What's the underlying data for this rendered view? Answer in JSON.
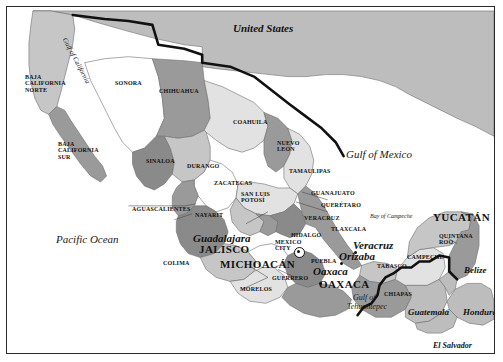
{
  "figure": {
    "width": 503,
    "height": 362
  },
  "palette": {
    "water": "#ffffff",
    "land_light": "#e2e2e2",
    "land_mid": "#c6c6c6",
    "land_dark": "#9a9a9a",
    "land_darker": "#8a8a8a",
    "neighbor_gray": "#bdbdbd",
    "outline": "#6e6e6e",
    "border_bold": "#111111",
    "frame": "#2a2a2a",
    "text": "#121212"
  },
  "countries": [
    {
      "name": "United States",
      "x": 232,
      "y": 22,
      "size": 11,
      "style": "italic"
    },
    {
      "name": "Belize",
      "x": 463,
      "y": 265,
      "size": 9,
      "style": "italic"
    },
    {
      "name": "Guatemala",
      "x": 407,
      "y": 307,
      "size": 9,
      "style": "italic"
    },
    {
      "name": "Honduras",
      "x": 462,
      "y": 307,
      "size": 9,
      "style": "italic"
    },
    {
      "name": "El Salvador",
      "x": 432,
      "y": 341,
      "size": 8,
      "style": "italic"
    }
  ],
  "waters": [
    {
      "name": "Pacific Ocean",
      "x": 55,
      "y": 233,
      "size": 11,
      "rotate": 0
    },
    {
      "name": "Gulf of Mexico",
      "x": 345,
      "y": 148,
      "size": 11,
      "rotate": 0
    },
    {
      "name": "Gulf of California",
      "x": 66,
      "y": 36,
      "size": 7,
      "rotate": 62
    },
    {
      "name": "Bay of Campeche",
      "x": 369,
      "y": 212,
      "size": 6,
      "rotate": 0
    },
    {
      "name": "Gulf of",
      "x": 352,
      "y": 293,
      "size": 8,
      "rotate": 0
    },
    {
      "name": "Tehuantepec",
      "x": 346,
      "y": 302,
      "size": 8,
      "rotate": 0
    }
  ],
  "states": [
    {
      "name": "BAJA CALIFORNIA NORTE",
      "lines": [
        "BAJA",
        "CALIFORNIA",
        "NORTE"
      ],
      "x": 24,
      "y": 73,
      "size": 6
    },
    {
      "name": "BAJA CALIFORNIA SUR",
      "lines": [
        "BAJA",
        "CALIFORNIA",
        "SUR"
      ],
      "x": 57,
      "y": 140,
      "size": 6
    },
    {
      "name": "SONORA",
      "lines": [
        "SONORA"
      ],
      "x": 114,
      "y": 79,
      "size": 6
    },
    {
      "name": "CHIHUAHUA",
      "lines": [
        "CHIHUAHUA"
      ],
      "x": 158,
      "y": 87,
      "size": 6
    },
    {
      "name": "COAHUILA",
      "lines": [
        "COAHUILA"
      ],
      "x": 232,
      "y": 118,
      "size": 6
    },
    {
      "name": "SINALOA",
      "lines": [
        "SINALOA"
      ],
      "x": 145,
      "y": 157,
      "size": 6
    },
    {
      "name": "DURANGO",
      "lines": [
        "DURANGO"
      ],
      "x": 186,
      "y": 162,
      "size": 6
    },
    {
      "name": "NUEVO LEON",
      "lines": [
        "NUEVO",
        "LEÓN"
      ],
      "x": 276,
      "y": 139,
      "size": 6
    },
    {
      "name": "TAMAULIPAS",
      "lines": [
        "TAMAULIPAS"
      ],
      "x": 288,
      "y": 167,
      "size": 6
    },
    {
      "name": "ZACATECAS",
      "lines": [
        "ZACATECAS"
      ],
      "x": 213,
      "y": 179,
      "size": 6
    },
    {
      "name": "SAN LUIS POTOSI",
      "lines": [
        "SAN LUIS",
        "POTOSÍ"
      ],
      "x": 240,
      "y": 190,
      "size": 6
    },
    {
      "name": "GUANAJUATO",
      "lines": [
        "GUANAJUATO"
      ],
      "x": 310,
      "y": 189,
      "size": 6
    },
    {
      "name": "QUERETARO",
      "lines": [
        "QUERÉTARO"
      ],
      "x": 320,
      "y": 201,
      "size": 6
    },
    {
      "name": "AGUASCALIENTES",
      "lines": [
        "AGUASCALIENTES"
      ],
      "x": 131,
      "y": 205,
      "size": 6
    },
    {
      "name": "NAYARIT",
      "lines": [
        "NAYARIT"
      ],
      "x": 194,
      "y": 211,
      "size": 6
    },
    {
      "name": "VERACRUZ",
      "lines": [
        "VERACRUZ"
      ],
      "x": 303,
      "y": 214,
      "size": 6
    },
    {
      "name": "TLAXCALA",
      "lines": [
        "TLAXCALA"
      ],
      "x": 330,
      "y": 225,
      "size": 6
    },
    {
      "name": "HIDALGO",
      "lines": [
        "HIDALGO"
      ],
      "x": 290,
      "y": 231,
      "size": 6
    },
    {
      "name": "JALISCO",
      "lines": [
        "JALISCO"
      ],
      "x": 198,
      "y": 243,
      "size": 11
    },
    {
      "name": "MEXICO CITY",
      "lines": [
        "MEXICO",
        "CITY"
      ],
      "x": 274,
      "y": 238,
      "size": 6
    },
    {
      "name": "PUEBLA",
      "lines": [
        "PUEBLA"
      ],
      "x": 310,
      "y": 257,
      "size": 6
    },
    {
      "name": "COLIMA",
      "lines": [
        "COLIMA"
      ],
      "x": 162,
      "y": 259,
      "size": 6
    },
    {
      "name": "MICHOACAN",
      "lines": [
        "MICHOACÁN"
      ],
      "x": 219,
      "y": 258,
      "size": 11
    },
    {
      "name": "GUERRERO",
      "lines": [
        "GUERRERO"
      ],
      "x": 271,
      "y": 274,
      "size": 6
    },
    {
      "name": "MORELOS",
      "lines": [
        "MORELOS"
      ],
      "x": 239,
      "y": 285,
      "size": 6
    },
    {
      "name": "OAXACA",
      "lines": [
        "OAXACA"
      ],
      "x": 318,
      "y": 278,
      "size": 11
    },
    {
      "name": "TABASCO",
      "lines": [
        "TABASCO"
      ],
      "x": 376,
      "y": 262,
      "size": 6
    },
    {
      "name": "CHIAPAS",
      "lines": [
        "CHIAPAS"
      ],
      "x": 383,
      "y": 290,
      "size": 6
    },
    {
      "name": "CAMPECHE",
      "lines": [
        "CAMPECHE"
      ],
      "x": 406,
      "y": 253,
      "size": 6
    },
    {
      "name": "YUCATAN",
      "lines": [
        "YUCATÁN"
      ],
      "x": 432,
      "y": 211,
      "size": 11
    },
    {
      "name": "QUINTANA ROO",
      "lines": [
        "QUINTANA",
        "ROO"
      ],
      "x": 438,
      "y": 232,
      "size": 6
    }
  ],
  "cities": [
    {
      "name": "Guadalajara",
      "x": 192,
      "y": 232,
      "size": 11,
      "marker": "none",
      "marker_x": 0,
      "marker_y": 0
    },
    {
      "name": "Veracruz",
      "x": 352,
      "y": 239,
      "size": 11,
      "marker": "dot",
      "marker_x": 347,
      "marker_y": 244
    },
    {
      "name": "Orizaba",
      "x": 338,
      "y": 250,
      "size": 11,
      "marker": "dot",
      "marker_x": 333,
      "marker_y": 255
    },
    {
      "name": "Oaxaca",
      "x": 312,
      "y": 265,
      "size": 11,
      "marker": "dot",
      "marker_x": 312,
      "marker_y": 275
    },
    {
      "name": "Mexico City",
      "x": 0,
      "y": 0,
      "size": 0,
      "marker": "capital",
      "marker_x": 287,
      "marker_y": 240
    }
  ]
}
